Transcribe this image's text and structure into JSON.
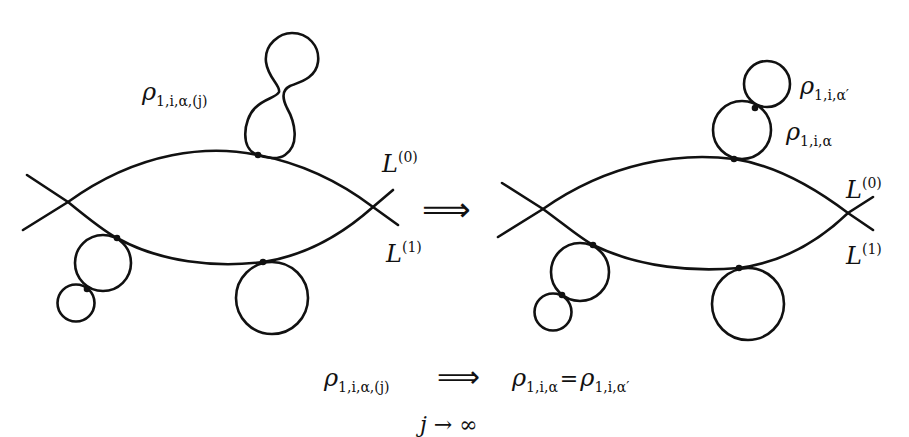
{
  "figure": {
    "type": "pseudo-holomorphic disk bubbling diagram",
    "stroke_color": "#111111",
    "background": "#ffffff"
  },
  "left_panel": {
    "bubble_label": {
      "base": "ρ",
      "sub": "1,i,α,(j)"
    },
    "lag0_label": {
      "base": "L",
      "sup": "(0)"
    },
    "lag1_label": {
      "base": "L",
      "sup": "(1)"
    }
  },
  "middle_arrow": {
    "symbol": "⟹"
  },
  "right_panel": {
    "top_bubble_label": {
      "base": "ρ",
      "sub": "1,i,α′"
    },
    "lower_bubble_label": {
      "base": "ρ",
      "sub": "1,i,α"
    },
    "lag0_label": {
      "base": "L",
      "sup": "(0)"
    },
    "lag1_label": {
      "base": "L",
      "sup": "(1)"
    }
  },
  "caption": {
    "lhs": {
      "base": "ρ",
      "sub": "1,i,α,(j)"
    },
    "arrow": "⟹",
    "rhs1": {
      "base": "ρ",
      "sub": "1,i,α"
    },
    "equals": "=",
    "rhs2": {
      "base": "ρ",
      "sub": "1,i,α′"
    },
    "limit": "j → ∞"
  }
}
